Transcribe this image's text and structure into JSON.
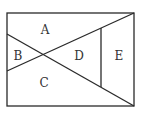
{
  "diagram": {
    "type": "geometry-partition",
    "stroke_color": "#2a2a2a",
    "label_color": "#333333",
    "rectangle": {
      "x1": 7,
      "y1": 13,
      "x2": 134,
      "y2": 106
    },
    "lines": [
      {
        "name": "diagonal-down",
        "x1": 7,
        "y1": 34,
        "x2": 134,
        "y2": 106
      },
      {
        "name": "diagonal-up",
        "x1": 7,
        "y1": 71,
        "x2": 134,
        "y2": 13
      },
      {
        "name": "vertical-segment",
        "x1": 101,
        "y1": 28,
        "x2": 101,
        "y2": 87
      }
    ],
    "regions": [
      {
        "label": "A",
        "x": 45,
        "y": 30
      },
      {
        "label": "B",
        "x": 18,
        "y": 56
      },
      {
        "label": "C",
        "x": 44,
        "y": 83
      },
      {
        "label": "D",
        "x": 79,
        "y": 56
      },
      {
        "label": "E",
        "x": 119,
        "y": 56
      }
    ]
  }
}
